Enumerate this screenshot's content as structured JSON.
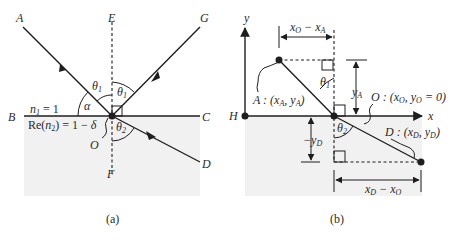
{
  "panel_a": {
    "caption": "(a)",
    "points": {
      "A": "A",
      "E": "E",
      "G": "G",
      "B": "B",
      "C": "C",
      "D": "D",
      "O": "O",
      "F": "F"
    },
    "angles": {
      "theta1_incident": "θ",
      "theta1_incident_sub": "1",
      "theta1_reflected": "θ",
      "theta1_reflected_sub": "1",
      "theta2": "θ",
      "theta2_sub": "2",
      "alpha": "α"
    },
    "media": {
      "n1_label": "n",
      "n1_sub": "1",
      "n1_value": " = 1",
      "n2_prefix": "Re(",
      "n2_var": "n",
      "n2_sub": "2",
      "n2_value": ") = 1 − ",
      "n2_delta": "δ"
    },
    "colors": {
      "line": "#1e1e1e",
      "medium2": "#f1f1f1",
      "background": "#ffffff"
    }
  },
  "panel_b": {
    "caption": "(b)",
    "axes": {
      "x": "x",
      "y": "y"
    },
    "points": {
      "H": "H"
    },
    "labels": {
      "A_coord": "A : (x",
      "A_sub1": "A",
      "A_mid": ", y",
      "A_sub2": "A",
      "A_end": ")",
      "O_coord": "O : (x",
      "O_sub1": "O",
      "O_mid": ", y",
      "O_sub2": "O",
      "O_end": " = 0)",
      "D_coord": "D : (x",
      "D_sub1": "D",
      "D_mid": ", y",
      "D_sub2": "D",
      "D_end": ")",
      "dx_top": "x",
      "dx_top_sub1": "O",
      "dx_top_mid": " − x",
      "dx_top_sub2": "A",
      "dy_top": "y",
      "dy_top_sub": "A",
      "dy_bot": "−y",
      "dy_bot_sub": "D",
      "dx_bot": "x",
      "dx_bot_sub1": "D",
      "dx_bot_mid": " − x",
      "dx_bot_sub2": "O",
      "theta1": "θ",
      "theta1_sub": "1",
      "theta2": "θ",
      "theta2_sub": "2"
    },
    "colors": {
      "line": "#1e1e1e",
      "medium2": "#f1f1f1"
    }
  }
}
